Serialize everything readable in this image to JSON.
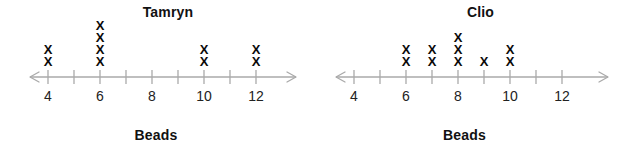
{
  "chart_data": [
    {
      "type": "bar",
      "plot_style": "dot-plot",
      "title": "Tamryn",
      "xlabel": "Beads",
      "ylabel": "",
      "mark": "X",
      "x": [
        4,
        5,
        6,
        7,
        8,
        9,
        10,
        11,
        12
      ],
      "values": [
        2,
        0,
        4,
        0,
        0,
        0,
        2,
        0,
        2
      ],
      "categories": [
        "4",
        "5",
        "6",
        "7",
        "8",
        "9",
        "10",
        "11",
        "12"
      ],
      "tick_values": [
        4,
        5,
        6,
        7,
        8,
        9,
        10,
        11,
        12
      ],
      "tick_labels": [
        "4",
        "",
        "6",
        "",
        "8",
        "",
        "10",
        "",
        "12"
      ],
      "labeled_ticks": [
        {
          "value": 4,
          "label": "4"
        },
        {
          "value": 6,
          "label": "6"
        },
        {
          "value": 8,
          "label": "8"
        },
        {
          "value": 10,
          "label": "10"
        },
        {
          "value": 12,
          "label": "12"
        }
      ],
      "xlim": [
        4,
        12
      ],
      "ylim": [
        0,
        4
      ],
      "grid": false,
      "legend": "none",
      "axis_arrows": "both"
    },
    {
      "type": "bar",
      "plot_style": "dot-plot",
      "title": "Clio",
      "xlabel": "Beads",
      "ylabel": "",
      "mark": "X",
      "x": [
        4,
        5,
        6,
        7,
        8,
        9,
        10,
        11,
        12
      ],
      "values": [
        0,
        0,
        2,
        2,
        3,
        1,
        2,
        0,
        0
      ],
      "categories": [
        "4",
        "5",
        "6",
        "7",
        "8",
        "9",
        "10",
        "11",
        "12"
      ],
      "tick_values": [
        4,
        5,
        6,
        7,
        8,
        9,
        10,
        11,
        12
      ],
      "tick_labels": [
        "4",
        "",
        "6",
        "",
        "8",
        "",
        "10",
        "",
        "12"
      ],
      "labeled_ticks": [
        {
          "value": 4,
          "label": "4"
        },
        {
          "value": 6,
          "label": "6"
        },
        {
          "value": 8,
          "label": "8"
        },
        {
          "value": 10,
          "label": "10"
        },
        {
          "value": 12,
          "label": "12"
        }
      ],
      "xlim": [
        4,
        12
      ],
      "ylim": [
        0,
        3
      ],
      "grid": false,
      "legend": "none",
      "axis_arrows": "both"
    }
  ],
  "colors": {
    "background": "#ffffff",
    "axis": "#aaaaaa",
    "mark": "#0a0a0a",
    "title": "#111111",
    "tick_label": "#222222"
  }
}
